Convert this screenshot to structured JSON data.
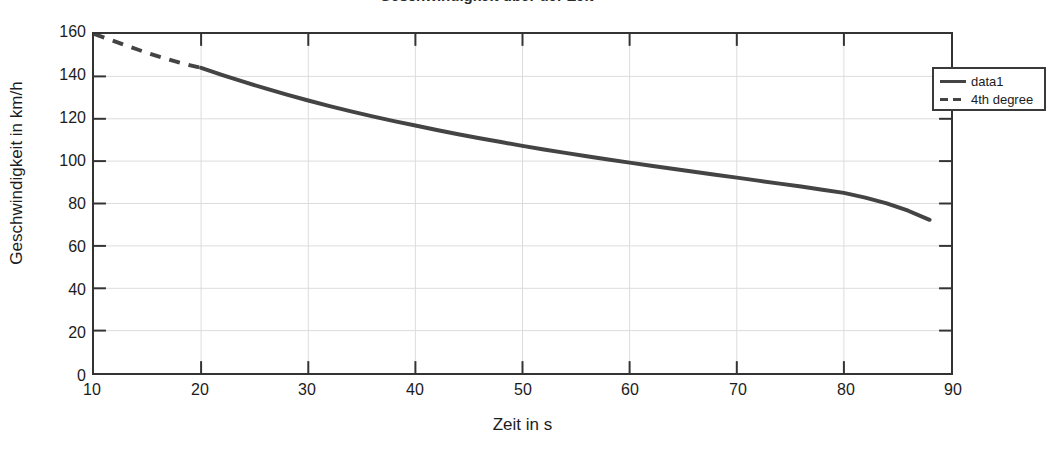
{
  "figure": {
    "title_fragment": "Geschwindigkeit uber der Zeit",
    "background_color": "#ffffff",
    "frame_color": "#333333",
    "grid_color": "#dcdcdc",
    "line_color": "#444444"
  },
  "legend": {
    "position": "top-right",
    "entries": [
      {
        "label": "data1",
        "style": "solid",
        "icon": "solid-line-swatch"
      },
      {
        "label": "4th degree",
        "style": "dashed",
        "icon": "dashed-line-swatch"
      }
    ]
  },
  "axes": {
    "xlabel": "Zeit in s",
    "ylabel": "Geschwindigkeit in km/h",
    "xticks": [
      "10",
      "20",
      "30",
      "40",
      "50",
      "60",
      "70",
      "80",
      "90"
    ],
    "yticks": [
      "0",
      "20",
      "40",
      "60",
      "80",
      "100",
      "120",
      "140",
      "160"
    ]
  },
  "chart_data": {
    "type": "line",
    "title": "Geschwindigkeit uber der Zeit",
    "xlabel": "Zeit in s",
    "ylabel": "Geschwindigkeit in km/h",
    "xlim": [
      10,
      90
    ],
    "ylim": [
      0,
      160
    ],
    "xticks": [
      10,
      20,
      30,
      40,
      50,
      60,
      70,
      80,
      90
    ],
    "yticks": [
      0,
      20,
      40,
      60,
      80,
      100,
      120,
      140,
      160
    ],
    "grid": true,
    "legend_position": "upper right",
    "series": [
      {
        "name": "4th degree",
        "style": "dashed",
        "color": "#444444",
        "x": [
          10,
          11,
          12,
          13,
          14,
          15,
          16,
          17,
          18,
          19,
          20
        ],
        "values": [
          160.0,
          158.2,
          156.4,
          154.6,
          152.8,
          151.0,
          149.4,
          147.9,
          146.5,
          145.2,
          144.0
        ]
      },
      {
        "name": "data1",
        "style": "solid",
        "color": "#444444",
        "x": [
          20,
          22,
          24,
          26,
          28,
          30,
          32,
          34,
          36,
          38,
          40,
          42,
          44,
          46,
          48,
          50,
          52,
          54,
          56,
          58,
          60,
          62,
          64,
          66,
          68,
          70,
          72,
          74,
          76,
          78,
          80,
          82,
          84,
          86,
          88
        ],
        "values": [
          144.0,
          140.6,
          137.4,
          134.3,
          131.4,
          128.6,
          126.0,
          123.5,
          121.1,
          118.9,
          116.8,
          114.7,
          112.7,
          110.8,
          109.0,
          107.2,
          105.5,
          103.9,
          102.3,
          100.8,
          99.3,
          97.8,
          96.4,
          95.0,
          93.6,
          92.2,
          90.8,
          89.4,
          88.0,
          86.5,
          85.0,
          82.8,
          80.1,
          76.6,
          72.3
        ]
      }
    ]
  }
}
